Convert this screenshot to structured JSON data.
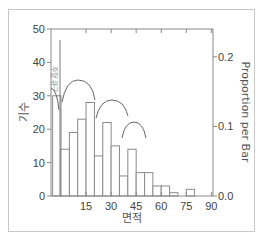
{
  "chart_data": {
    "type": "bar",
    "title": "",
    "xlabel": "면적",
    "ylabel": "기수",
    "y2label": "Proportion per Bar",
    "bin_width": 5,
    "bins_start": [
      -5,
      0,
      5,
      10,
      15,
      20,
      25,
      30,
      35,
      40,
      45,
      50,
      55,
      60,
      65,
      70,
      75,
      80,
      85
    ],
    "values": [
      30,
      14,
      19,
      23,
      28,
      12,
      22,
      15,
      6,
      14,
      7,
      7,
      3,
      3,
      1,
      0,
      2,
      0,
      0
    ],
    "xlim": [
      -6,
      91
    ],
    "ylim": [
      0,
      50
    ],
    "y2lim": [
      0.0,
      0.24
    ],
    "x_ticks": [
      15,
      30,
      45,
      60,
      75,
      90
    ],
    "x_tick_labels": [
      "15",
      "30",
      "45",
      "60",
      "75",
      "90"
    ],
    "y_ticks": [
      0,
      10,
      20,
      30,
      40,
      50
    ],
    "y_tick_labels": [
      "0",
      "10",
      "20",
      "30",
      "40",
      "50"
    ],
    "y2_ticks": [
      0.0,
      0.1,
      0.2
    ],
    "y2_tick_labels": [
      "0.0",
      "0.1",
      "0.2"
    ],
    "grid": false,
    "legend": null,
    "annotations": [
      {
        "text": "주형 큐구",
        "type": "vertical-line",
        "x": 0
      }
    ]
  },
  "labels": {
    "xlabel": "면적",
    "ylabel": "기수",
    "y2label": "Proportion per Bar",
    "annotation": "주형 큐구"
  },
  "colors": {
    "axis": "#888888",
    "bar_stroke": "#8a8a8a",
    "bar_fill": "#ffffff",
    "text": "#444444"
  }
}
